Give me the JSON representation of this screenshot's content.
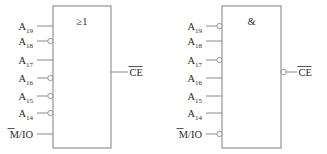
{
  "figure": {
    "stroke_color": "#8a8a8a",
    "text_color": "#2b2b2b",
    "background": "#ffffff"
  },
  "gates": [
    {
      "id": "or-gate",
      "symbol": "≥1",
      "symbol_name": "greater-or-equal-one-symbol",
      "function": "OR",
      "output": {
        "label_main": "CE",
        "label_overline": true,
        "inverted": false
      },
      "inputs": [
        {
          "label_main": "A",
          "subscript": "19",
          "overline": false,
          "inverted": false
        },
        {
          "label_main": "A",
          "subscript": "18",
          "overline": false,
          "inverted": true
        },
        {
          "label_main": "A",
          "subscript": "17",
          "overline": false,
          "inverted": false
        },
        {
          "label_main": "A",
          "subscript": "16",
          "overline": false,
          "inverted": true
        },
        {
          "label_main": "A",
          "subscript": "15",
          "overline": false,
          "inverted": true
        },
        {
          "label_main": "A",
          "subscript": "14",
          "overline": false,
          "inverted": true
        },
        {
          "label_main": "M/IO",
          "subscript": "",
          "overline": true,
          "inverted": false
        }
      ]
    },
    {
      "id": "and-gate",
      "symbol": "&",
      "symbol_name": "ampersand-and-symbol",
      "function": "AND",
      "output": {
        "label_main": "CE",
        "label_overline": true,
        "inverted": true
      },
      "inputs": [
        {
          "label_main": "A",
          "subscript": "19",
          "overline": false,
          "inverted": true
        },
        {
          "label_main": "A",
          "subscript": "18",
          "overline": false,
          "inverted": false
        },
        {
          "label_main": "A",
          "subscript": "17",
          "overline": false,
          "inverted": true
        },
        {
          "label_main": "A",
          "subscript": "16",
          "overline": false,
          "inverted": false
        },
        {
          "label_main": "A",
          "subscript": "15",
          "overline": false,
          "inverted": false
        },
        {
          "label_main": "A",
          "subscript": "14",
          "overline": false,
          "inverted": false
        },
        {
          "label_main": "M/IO",
          "subscript": "",
          "overline": true,
          "inverted": true
        }
      ]
    }
  ]
}
